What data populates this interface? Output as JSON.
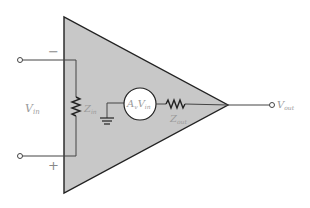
{
  "diagram": {
    "title": "",
    "colors": {
      "body_fill": "#c8c8c8",
      "stroke": "#222222",
      "wire": "#444444",
      "label": "#9a9a9a"
    },
    "labels": {
      "minus_sign": "−",
      "plus_sign": "+",
      "vin": "V",
      "vin_sub": "in",
      "zin": "Z",
      "zin_sub": "in",
      "source_a": "A",
      "source_a_sub": "v",
      "source_v": "V",
      "source_v_sub": "in",
      "zout": "Z",
      "zout_sub": "out",
      "vout": "V",
      "vout_sub": "out"
    },
    "components": [
      {
        "id": "amplifier-triangle",
        "type": "triangle"
      },
      {
        "id": "input-impedance",
        "type": "resistor",
        "label": "Zin"
      },
      {
        "id": "dependent-source",
        "type": "voltage-source",
        "label": "AvVin"
      },
      {
        "id": "output-impedance",
        "type": "resistor",
        "label": "Zout"
      },
      {
        "id": "ground",
        "type": "ground"
      },
      {
        "id": "input-terminal-minus",
        "type": "terminal"
      },
      {
        "id": "input-terminal-plus",
        "type": "terminal"
      },
      {
        "id": "output-terminal",
        "type": "terminal",
        "label": "Vout"
      }
    ]
  }
}
